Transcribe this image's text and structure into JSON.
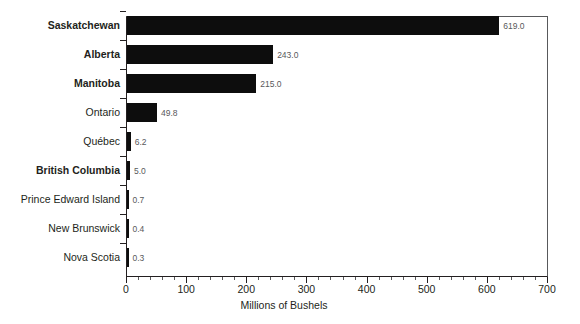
{
  "chart_data": {
    "type": "bar",
    "orientation": "horizontal",
    "title": "",
    "xlabel": "Millions of Bushels",
    "ylabel": "",
    "xlim": [
      0,
      700
    ],
    "xticks": [
      0,
      100,
      200,
      300,
      400,
      500,
      600,
      700
    ],
    "xtick_labels": [
      "0",
      "100",
      "200",
      "300",
      "400",
      "500",
      "600",
      "700"
    ],
    "minor_tick_step": 20,
    "grid": false,
    "legend": null,
    "bar_color": "#0d0d0d",
    "categories": [
      "Saskatchewan",
      "Alberta",
      "Manitoba",
      "Ontario",
      "Québec",
      "British Columbia",
      "Prince Edward Island",
      "New Brunswick",
      "Nova Scotia"
    ],
    "values": [
      619.0,
      243.0,
      215.0,
      49.8,
      6.2,
      5.0,
      0.7,
      0.4,
      0.3
    ],
    "data_labels": [
      "619.0",
      "243.0",
      "215.0",
      "49.8",
      "6.2",
      "5.0",
      "0.7",
      "0.4",
      "0.3"
    ],
    "emphasis": [
      true,
      true,
      true,
      false,
      false,
      true,
      false,
      false,
      false
    ],
    "bars": [
      {
        "category": "Saskatchewan",
        "value": 619.0,
        "label": "619.0",
        "bold": true
      },
      {
        "category": "Alberta",
        "value": 243.0,
        "label": "243.0",
        "bold": true
      },
      {
        "category": "Manitoba",
        "value": 215.0,
        "label": "215.0",
        "bold": true
      },
      {
        "category": "Ontario",
        "value": 49.8,
        "label": "49.8",
        "bold": false
      },
      {
        "category": "Québec",
        "value": 6.2,
        "label": "6.2",
        "bold": false
      },
      {
        "category": "British Columbia",
        "value": 5.0,
        "label": "5.0",
        "bold": true
      },
      {
        "category": "Prince Edward Island",
        "value": 0.7,
        "label": "0.7",
        "bold": false
      },
      {
        "category": "New Brunswick",
        "value": 0.4,
        "label": "0.4",
        "bold": false
      },
      {
        "category": "Nova Scotia",
        "value": 0.3,
        "label": "0.3",
        "bold": false
      }
    ]
  }
}
